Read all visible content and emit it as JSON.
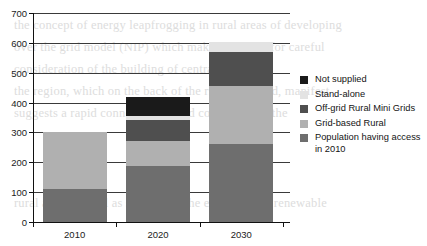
{
  "chart_data": {
    "type": "bar",
    "subtype": "stacked-vertical",
    "title": "",
    "xlabel": "",
    "ylabel": "",
    "categories": [
      "2010",
      "2020",
      "2030"
    ],
    "ylim": [
      0,
      700
    ],
    "ytick_labels": [
      "0",
      "100",
      "200",
      "300",
      "400",
      "500",
      "600",
      "700"
    ],
    "ytick_values": [
      0,
      100,
      200,
      300,
      400,
      500,
      600,
      700
    ],
    "ytick_step": 100,
    "grid": true,
    "grid_axis": "y",
    "legend_position": "right",
    "stack_order": "bottom-to-top",
    "series": [
      {
        "name": "Population having access in 2010",
        "color": "#6e6e6e",
        "values": [
          110,
          188,
          260
        ]
      },
      {
        "name": "Grid-based Rural",
        "color": "#b0b0b0",
        "values": [
          190,
          82,
          195
        ]
      },
      {
        "name": "Off-grid Rural Mini Grids",
        "color": "#4f4f4f",
        "values": [
          0,
          73,
          115
        ]
      },
      {
        "name": "Stand-alone",
        "color": "#e3e3e3",
        "values": [
          0,
          12,
          32
        ]
      },
      {
        "name": "Not supplied",
        "color": "#1a1a1a",
        "values": [
          0,
          65,
          0
        ]
      }
    ],
    "totals": [
      300,
      430,
      602
    ]
  },
  "legend": {
    "entries": [
      {
        "label": "Not supplied",
        "color": "#1a1a1a"
      },
      {
        "label": "Stand-alone",
        "color": "#e3e3e3"
      },
      {
        "label": "Off-grid Rural Mini Grids",
        "color": "#4f4f4f"
      },
      {
        "label": "Grid-based Rural",
        "color": "#b0b0b0"
      },
      {
        "label": "Population having access in 2010",
        "color": "#6e6e6e"
      }
    ]
  },
  "background_text": {
    "lines": [
      "the concept of energy leapfrogging in rural areas of developing",
      "over the grid model (NIP) which makes the need for careful",
      "consideration of the building of centralized",
      "the region, which on the back of the rising demand, manifest",
      "suggests a rapid connection to grid connection in the",
      "rural areas as well as supporting the expansion of renewable"
    ]
  }
}
